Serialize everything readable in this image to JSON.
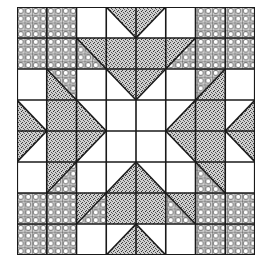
{
  "grid": {
    "rows": 8,
    "cols": 8,
    "cell_w": 29.75,
    "cell_h": 31,
    "legend": {
      "P": "circle-lattice fabric",
      "S": "stippled fabric",
      "W": "white fabric"
    },
    "colors": {
      "line": "#1a1a1a",
      "white": "#ffffff",
      "stipple_base": "#c8c8c8",
      "plaid_base": "#d6d6d6"
    },
    "cells": [
      [
        "P",
        "P",
        "W",
        "TR:\\:S:W",
        "TL:/:S:W",
        "W",
        "P",
        "P"
      ],
      [
        "P",
        "P",
        "TR:\\:S:P",
        "S",
        "S",
        "TL:/:S:P",
        "P",
        "P"
      ],
      [
        "W",
        "TR:\\:P:S",
        "W",
        "TR:\\:S:W",
        "TL:/:S:W",
        "W",
        "TL:/:P:S",
        "W"
      ],
      [
        "BL:\\:S:W",
        "S",
        "BL:\\:S:W",
        "W",
        "W",
        "BR:/:S:W",
        "S",
        "BR:/:S:W"
      ],
      [
        "TL:/:S:W",
        "S",
        "TL:/:S:W",
        "W",
        "W",
        "TR:\\:S:W",
        "S",
        "TR:\\:S:W"
      ],
      [
        "W",
        "TL:/:S:P",
        "W",
        "BR:/:S:W",
        "BL:\\:S:W",
        "W",
        "TR:\\:S:P",
        "W"
      ],
      [
        "P",
        "P",
        "BL:/:P:S",
        "S",
        "S",
        "BR:\\:P:S",
        "P",
        "P"
      ],
      [
        "P",
        "P",
        "W",
        "BR:/:S:W",
        "BL:\\:S:W",
        "W",
        "P",
        "P"
      ]
    ]
  }
}
